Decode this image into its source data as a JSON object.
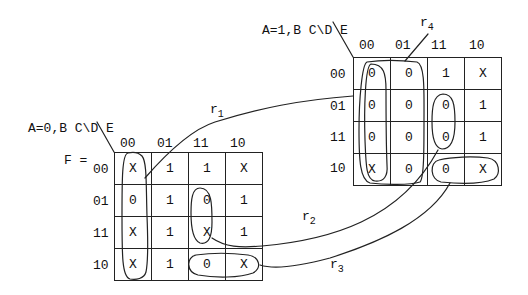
{
  "maps": [
    {
      "id": "map-a0",
      "var_label": "A=0,B C\\D E",
      "prefix_label": "F =",
      "col_headers": [
        "00",
        "01",
        "11",
        "10"
      ],
      "row_headers": [
        "00",
        "01",
        "11",
        "10"
      ],
      "cells": [
        [
          "X",
          "1",
          "1",
          "X"
        ],
        [
          "0",
          "1",
          "0",
          "1"
        ],
        [
          "X",
          "1",
          "X",
          "1"
        ],
        [
          "X",
          "1",
          "0",
          "X"
        ]
      ]
    },
    {
      "id": "map-a1",
      "var_label": "A=1,B C\\D E",
      "col_headers": [
        "00",
        "01",
        "11",
        "10"
      ],
      "row_headers": [
        "00",
        "01",
        "11",
        "10"
      ],
      "cells": [
        [
          "0",
          "0",
          "1",
          "X"
        ],
        [
          "0",
          "0",
          "0",
          "1"
        ],
        [
          "0",
          "0",
          "0",
          "1"
        ],
        [
          "X",
          "0",
          "0",
          "X"
        ]
      ]
    }
  ],
  "regions": [
    {
      "name": "r",
      "sub": "1",
      "desc": "column 00 of A=0 map joined with column 00 of A=1 map"
    },
    {
      "name": "r",
      "sub": "2",
      "desc": "rows 01,11 col 11 of A=0 map joined with A=1 map"
    },
    {
      "name": "r",
      "sub": "3",
      "desc": "row 10 cols 11,10 of A=0 map joined with A=1 map"
    },
    {
      "name": "r",
      "sub": "4",
      "desc": "columns 00,01 of A=1 map"
    }
  ]
}
